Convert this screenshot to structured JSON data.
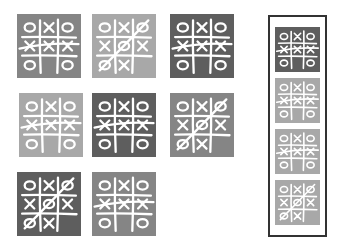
{
  "colors": {
    "dark": "#5e5e5e",
    "medium": "#858585",
    "light": "#a8a8a8",
    "chalk": "#ffffff",
    "frame_border": "#333333"
  },
  "boards": {
    "row_win": {
      "cells": [
        "O",
        "X",
        "O",
        "X",
        "X",
        "X",
        "O",
        "",
        "O"
      ],
      "strike": "middle-row"
    },
    "diag_win": {
      "cells": [
        "O",
        "X",
        "O",
        "X",
        "O",
        "X",
        "O",
        "X",
        ""
      ],
      "strike": "anti-diagonal"
    }
  },
  "grid_tiles": [
    {
      "x": 17,
      "y": 14,
      "size": 64,
      "shade": "medium",
      "board": "row_win"
    },
    {
      "x": 92,
      "y": 14,
      "size": 64,
      "shade": "light",
      "board": "diag_win"
    },
    {
      "x": 170,
      "y": 14,
      "size": 64,
      "shade": "dark",
      "board": "row_win"
    },
    {
      "x": 19,
      "y": 93,
      "size": 64,
      "shade": "light",
      "board": "row_win"
    },
    {
      "x": 92,
      "y": 93,
      "size": 64,
      "shade": "dark",
      "board": "row_win"
    },
    {
      "x": 170,
      "y": 93,
      "size": 64,
      "shade": "medium",
      "board": "diag_win"
    },
    {
      "x": 17,
      "y": 172,
      "size": 64,
      "shade": "dark",
      "board": "diag_win"
    },
    {
      "x": 92,
      "y": 172,
      "size": 64,
      "shade": "medium",
      "board": "row_win"
    }
  ],
  "frame_tiles": [
    {
      "x": 275,
      "y": 27,
      "size": 45,
      "shade": "dark",
      "board": "row_win"
    },
    {
      "x": 275,
      "y": 78,
      "size": 45,
      "shade": "light",
      "board": "row_win"
    },
    {
      "x": 275,
      "y": 129,
      "size": 45,
      "shade": "light",
      "board": "row_win"
    },
    {
      "x": 275,
      "y": 180,
      "size": 45,
      "shade": "light",
      "board": "diag_win"
    }
  ]
}
